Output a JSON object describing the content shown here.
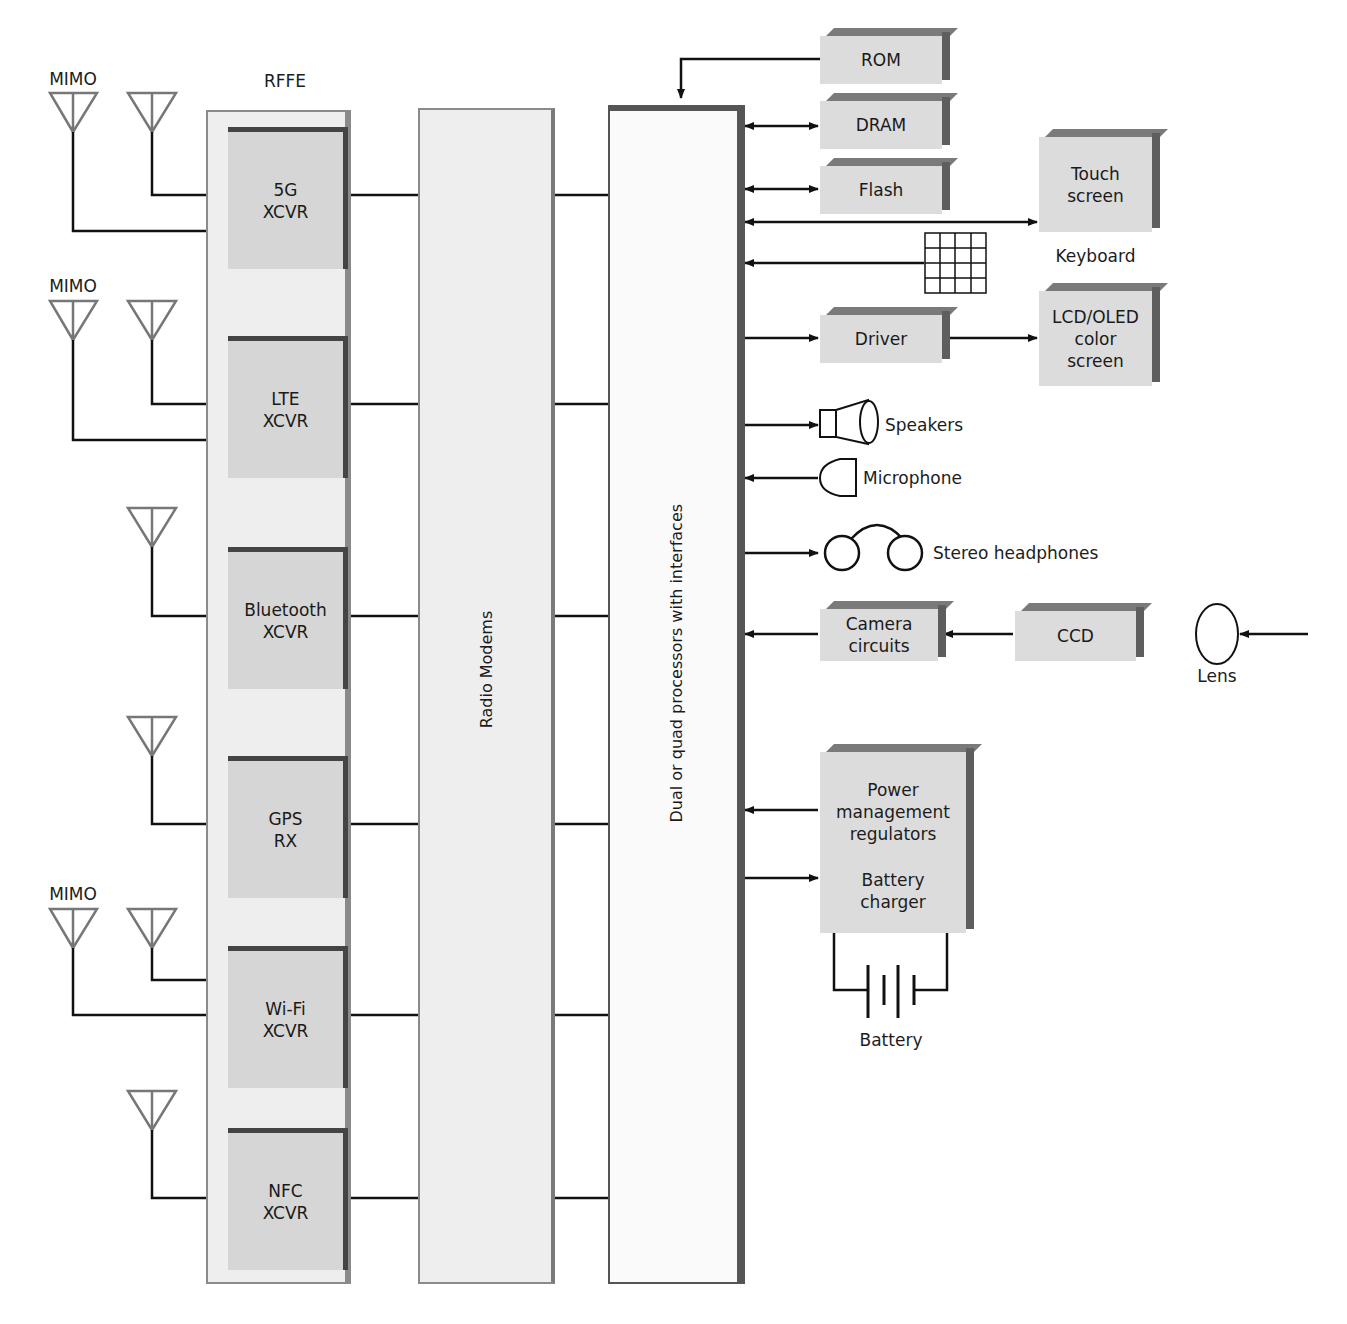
{
  "labels": {
    "rffe": "RFFE",
    "mimo": "MIMO",
    "radio_modems": "Radio Modems",
    "processor": "Dual or quad processors with interfaces"
  },
  "transceivers": [
    {
      "id": "5g",
      "label": "5G\nXCVR",
      "antennas": 2,
      "mimo": true
    },
    {
      "id": "lte",
      "label": "LTE\nXCVR",
      "antennas": 2,
      "mimo": true
    },
    {
      "id": "bluetooth",
      "label": "Bluetooth\nXCVR",
      "antennas": 1,
      "mimo": false
    },
    {
      "id": "gps",
      "label": "GPS\nRX",
      "antennas": 1,
      "mimo": false
    },
    {
      "id": "wifi",
      "label": "Wi-Fi\nXCVR",
      "antennas": 2,
      "mimo": true
    },
    {
      "id": "nfc",
      "label": "NFC\nXCVR",
      "antennas": 1,
      "mimo": false
    }
  ],
  "memory": [
    {
      "id": "rom",
      "label": "ROM",
      "direction": "into-processor"
    },
    {
      "id": "dram",
      "label": "DRAM",
      "direction": "bidirectional"
    },
    {
      "id": "flash",
      "label": "Flash",
      "direction": "bidirectional"
    }
  ],
  "peripherals": {
    "touch_screen": "Touch\nscreen",
    "keyboard": "Keyboard",
    "driver": "Driver",
    "lcd": "LCD/OLED\ncolor\nscreen",
    "speakers": "Speakers",
    "microphone": "Microphone",
    "headphones": "Stereo headphones",
    "camera_circuits": "Camera\ncircuits",
    "ccd": "CCD",
    "lens": "Lens",
    "power": "Power\nmanagement\nregulators",
    "battery_charger": "Battery\ncharger",
    "battery": "Battery"
  },
  "colors": {
    "block_fill": "#dcdcdc",
    "panel_fill": "#eeeeee",
    "shadow": "#5e5e5e",
    "line": "#111111",
    "antenna": "#777777"
  }
}
